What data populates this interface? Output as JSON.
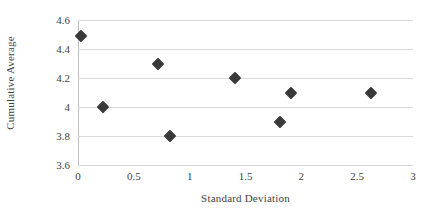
{
  "chart_data": {
    "type": "scatter",
    "title": "",
    "xlabel": "Standard Deviation",
    "ylabel": "Cumulative Average",
    "xlim": [
      0,
      3
    ],
    "ylim": [
      3.6,
      4.6
    ],
    "grid": true,
    "legend": false,
    "x_ticks": [
      "0",
      "0.5",
      "1",
      "1.5",
      "2",
      "2.5",
      "3"
    ],
    "x_tick_values": [
      0,
      0.5,
      1,
      1.5,
      2,
      2.5,
      3
    ],
    "y_ticks": [
      "3.6",
      "3.8",
      "4",
      "4.2",
      "4.4",
      "4.6"
    ],
    "y_tick_values": [
      3.6,
      3.8,
      4,
      4.2,
      4.4,
      4.6
    ],
    "series": [
      {
        "name": "Cumulative Average",
        "marker": "diamond",
        "color": "#3a3a3a",
        "points": [
          {
            "x": 0.03,
            "y": 4.49
          },
          {
            "x": 0.22,
            "y": 4.0
          },
          {
            "x": 0.72,
            "y": 4.3
          },
          {
            "x": 0.82,
            "y": 3.8
          },
          {
            "x": 1.41,
            "y": 4.2
          },
          {
            "x": 1.81,
            "y": 3.9
          },
          {
            "x": 1.91,
            "y": 4.1
          },
          {
            "x": 2.62,
            "y": 4.1
          }
        ]
      }
    ]
  },
  "style": {
    "background": "#ffffff",
    "gridline_color": "#d9d9d9",
    "axis_color": "#bfbfbf",
    "text_color": "#3f3f3f",
    "marker_color": "#3a3a3a"
  }
}
